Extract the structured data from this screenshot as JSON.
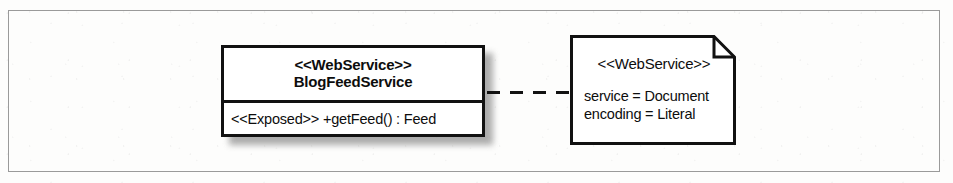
{
  "figure": {
    "kind": "uml-class-diagram",
    "background_color": "#fdfdfc",
    "frame_border_color": "#9a9a9a",
    "ink_color": "#111111"
  },
  "class_box": {
    "stereotype": "<<WebService>>",
    "name": "BlogFeedService",
    "operations": [
      "<<Exposed>> +getFeed() : Feed"
    ]
  },
  "connector": {
    "style": "dashed",
    "name": "dependency-link"
  },
  "note": {
    "stereotype": "<<WebService>>",
    "tagged_values": [
      "service = Document",
      "encoding = Literal"
    ]
  }
}
